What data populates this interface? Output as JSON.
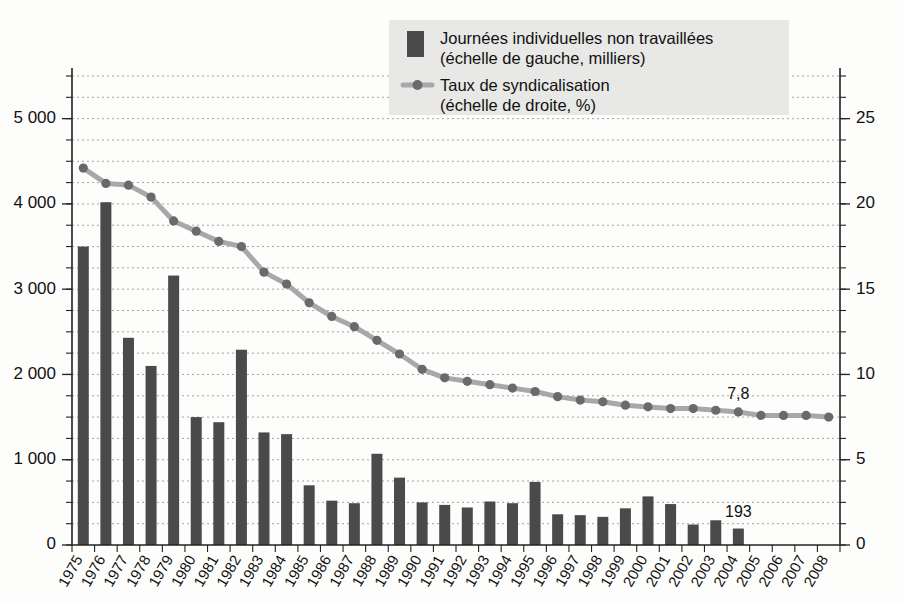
{
  "chart_data": {
    "type": "bar",
    "title": "",
    "subtitle": "",
    "xlabel": "",
    "ylabel": "",
    "grid": true,
    "legend_position": "top-right",
    "categories": [
      "1975",
      "1976",
      "1977",
      "1978",
      "1979",
      "1980",
      "1981",
      "1982",
      "1983",
      "1984",
      "1985",
      "1986",
      "1987",
      "1988",
      "1989",
      "1990",
      "1991",
      "1992",
      "1993",
      "1994",
      "1995",
      "1996",
      "1997",
      "1998",
      "1999",
      "2000",
      "2001",
      "2002",
      "2003",
      "2004",
      "2005",
      "2006",
      "2007",
      "2008"
    ],
    "series": [
      {
        "name": "Journées individuelles non travaillées",
        "type": "bar",
        "axis": "left",
        "unit": "milliers",
        "ylim": [
          0,
          5500
        ],
        "yticks": [
          0,
          1000,
          2000,
          3000,
          4000,
          5000
        ],
        "ytick_labels": [
          "0",
          "1 000",
          "2 000",
          "3 000",
          "4 000",
          "5 000"
        ],
        "minor_tick_step": 250,
        "color": "#4a4a4a",
        "values": [
          3500,
          4020,
          2430,
          2100,
          3160,
          1500,
          1440,
          2290,
          1320,
          1300,
          700,
          520,
          490,
          1070,
          790,
          500,
          470,
          440,
          510,
          490,
          740,
          360,
          350,
          330,
          430,
          570,
          480,
          240,
          290,
          193,
          null,
          null,
          null,
          null
        ]
      },
      {
        "name": "Taux de syndicalisation",
        "type": "line",
        "axis": "right",
        "unit": "%",
        "ylim": [
          0,
          27.5
        ],
        "yticks": [
          0,
          5,
          10,
          15,
          20,
          25
        ],
        "ytick_labels": [
          "0",
          "5",
          "10",
          "15",
          "20",
          "25"
        ],
        "minor_tick_step": 1.25,
        "color": "#a8a8a8",
        "marker_color": "#6a6a6a",
        "values": [
          22.1,
          21.2,
          21.1,
          20.4,
          19.0,
          18.4,
          17.8,
          17.5,
          16.0,
          15.3,
          14.2,
          13.4,
          12.8,
          12.0,
          11.2,
          10.3,
          9.8,
          9.6,
          9.4,
          9.2,
          9.0,
          8.7,
          8.5,
          8.4,
          8.2,
          8.1,
          8.0,
          8.0,
          7.9,
          7.8,
          7.6,
          7.6,
          7.6,
          7.5
        ]
      }
    ],
    "annotations": [
      {
        "text": "7,8",
        "series": "Taux de syndicalisation",
        "category": "2004",
        "value": 7.8
      },
      {
        "text": "193",
        "series": "Journées individuelles non travaillées",
        "category": "2004",
        "value": 193
      }
    ]
  },
  "legend": {
    "items": [
      {
        "marker": "bar-swatch",
        "line1": "Journées individuelles non travaillées",
        "line2": "(échelle de gauche, milliers)"
      },
      {
        "marker": "line-dot-marker",
        "line1": "Taux de syndicalisation",
        "line2": "(échelle de droite, %)"
      }
    ]
  },
  "colors": {
    "bar": "#4a4a4a",
    "line": "#a8a8a8",
    "marker": "#6a6a6a",
    "grid": "#9a9a9a",
    "axis": "#222222",
    "legend_panel": "#e8e8e6",
    "background": "#fdfdfc"
  }
}
